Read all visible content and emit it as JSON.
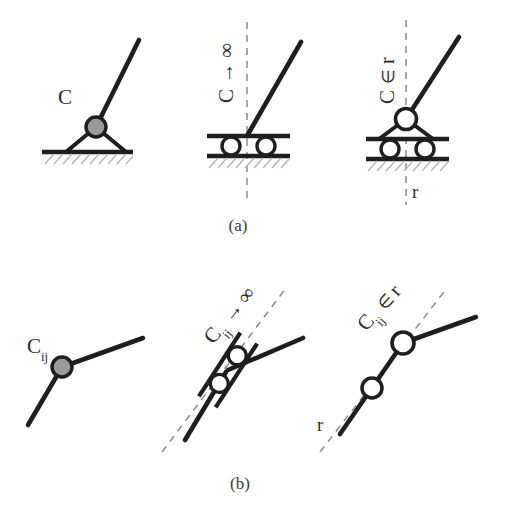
{
  "figure": {
    "title_visible": false,
    "panels": [
      {
        "id": "a",
        "caption": "(a)",
        "subpanels": [
          {
            "id": "a1",
            "label": "C",
            "label_subscript": "",
            "kind": "pin-support-on-ground",
            "joint_fill": "gray",
            "has_dashed_line": false,
            "dashed_label": ""
          },
          {
            "id": "a2",
            "label": "C",
            "label_subscript": "",
            "label_arrow": "→",
            "label_limit": "∞",
            "label_full": "C → ∞",
            "kind": "roller-support-on-ground",
            "joint_fill": "white",
            "has_dashed_line": true,
            "dashed_label": ""
          },
          {
            "id": "a3",
            "label": "C",
            "label_subscript": "",
            "label_relation": "∈",
            "label_set": "r",
            "label_full": "C ∈ r",
            "kind": "pin-on-roller-support",
            "joint_fill": "white",
            "has_dashed_line": true,
            "dashed_label": "r"
          }
        ]
      },
      {
        "id": "b",
        "caption": "(b)",
        "subpanels": [
          {
            "id": "b1",
            "label": "C",
            "label_subscript": "ij",
            "label_full": "Cᵢⱼ",
            "kind": "internal-pin-joint",
            "joint_fill": "gray",
            "has_dashed_line": false,
            "dashed_label": ""
          },
          {
            "id": "b2",
            "label": "C",
            "label_subscript": "ij",
            "label_arrow": "→",
            "label_limit": "∞",
            "label_full": "Cᵢⱼ → ∞",
            "kind": "internal-roller-joint",
            "joint_fill": "white",
            "has_dashed_line": true,
            "dashed_label": ""
          },
          {
            "id": "b3",
            "label": "C",
            "label_subscript": "ij",
            "label_relation": "∈",
            "label_set": "r",
            "label_full": "Cᵢⱼ ∈ r",
            "kind": "internal-double-pin-joint",
            "joint_fill": "white",
            "has_dashed_line": true,
            "dashed_label": "r"
          }
        ]
      }
    ],
    "symbols": {
      "infinity": "∞",
      "arrow_right": "→",
      "element_of": "∈",
      "set_r": "r",
      "subscript_ij": "ij",
      "constraint_c": "C"
    },
    "colors": {
      "line": "#1e1e1e",
      "joint_gray_fill": "#9a9a9a",
      "joint_white_fill": "#ffffff",
      "hatch": "#b8b8b8",
      "dashed": "#8a8a8a",
      "text": "#2b2b2b",
      "background": "#ffffff"
    }
  }
}
